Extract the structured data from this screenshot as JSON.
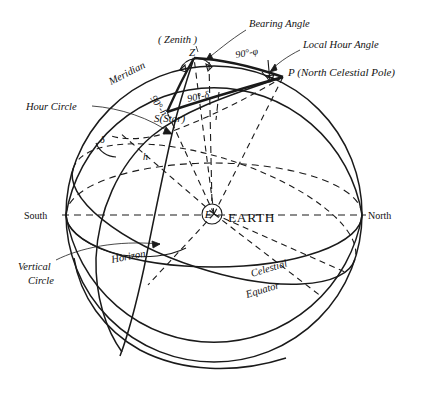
{
  "figure": {
    "background": "#ffffff",
    "ink": "#1a1a1a"
  },
  "points": {
    "zenith_symbol": "Z",
    "zenith_label": "( Zenith )",
    "pole": "P (North Celestial Pole)",
    "star": "S(Star)",
    "earth_symbol": "E",
    "earth_label": "EARTH"
  },
  "cardinal": {
    "south": "South",
    "north": "North"
  },
  "circles": {
    "meridian": "Meridian",
    "hour_circle": "Hour Circle",
    "vertical_circle_line1": "Vertical",
    "vertical_circle_line2": "Circle",
    "horizon": "Horizon",
    "celestial_equator_line1": "Celestial",
    "celestial_equator_line2": "Equator"
  },
  "angles": {
    "bearing_angle": "Bearing Angle",
    "local_hour_angle": "Local Hour Angle",
    "co_altitude": "90°-h",
    "co_declination": "90°-δ",
    "co_latitude": "90°-φ",
    "declination": "δ",
    "altitude": "h"
  }
}
